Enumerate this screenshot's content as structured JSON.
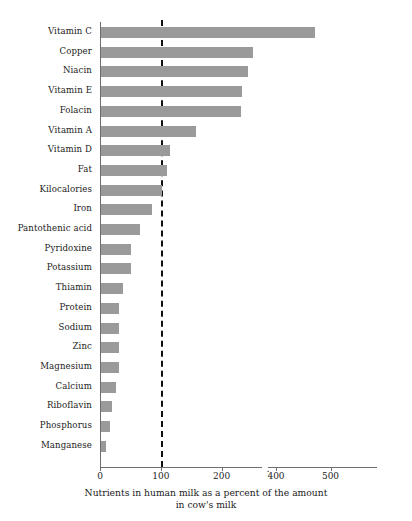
{
  "chart_data": {
    "type": "bar",
    "orientation": "horizontal",
    "title": "",
    "xlabel": "Nutrients in human milk as a percent of the amount in cow's milk",
    "ylabel": "",
    "categories": [
      "Vitamin C",
      "Copper",
      "Niacin",
      "Vitamin E",
      "Folacin",
      "Vitamin A",
      "Vitamin D",
      "Fat",
      "Kilocalories",
      "Iron",
      "Pantothenic acid",
      "Pyridoxine",
      "Potassium",
      "Thiamin",
      "Protein",
      "Sodium",
      "Zinc",
      "Magnesium",
      "Calcium",
      "Riboflavin",
      "Phosphorus",
      "Manganese"
    ],
    "values": [
      470,
      250,
      242,
      232,
      230,
      156,
      113,
      108,
      100,
      84,
      64,
      50,
      50,
      36,
      30,
      30,
      30,
      30,
      24,
      18,
      14,
      8
    ],
    "xlim": [
      0,
      560
    ],
    "xticks": [
      0,
      100,
      200,
      400,
      500
    ],
    "xtick_labels": [
      "0",
      "100",
      "200",
      "400",
      "500"
    ],
    "axis_break": {
      "present": true,
      "from": 240,
      "to": 370,
      "note": "broken x-axis between 200 and 400 tick region"
    },
    "reference_line": {
      "value": 100,
      "style": "dashed",
      "color": "#111111"
    },
    "bar_color": "#9a9a9a",
    "grid": false,
    "legend": null,
    "broken_bars": [
      "Vitamin C"
    ]
  },
  "caption": {
    "line1": "Nutrients in human milk as a percent of the amount",
    "line2": "in cow's milk"
  },
  "axis": {
    "tick_labels": [
      "0",
      "100",
      "200",
      "400",
      "500"
    ]
  },
  "labels": [
    "Vitamin C",
    "Copper",
    "Niacin",
    "Vitamin E",
    "Folacin",
    "Vitamin A",
    "Vitamin D",
    "Fat",
    "Kilocalories",
    "Iron",
    "Pantothenic acid",
    "Pyridoxine",
    "Potassium",
    "Thiamin",
    "Protein",
    "Sodium",
    "Zinc",
    "Magnesium",
    "Calcium",
    "Riboflavin",
    "Phosphorus",
    "Manganese"
  ]
}
